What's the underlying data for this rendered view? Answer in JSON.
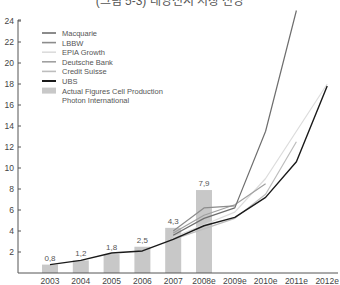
{
  "title": "(그림 5-3) 태양전지 시장 전망",
  "chart_data": {
    "type": "bar+line",
    "title": "",
    "xlabel": "",
    "ylabel": "",
    "ylim": [
      0,
      24
    ],
    "yticks": [
      2,
      4,
      6,
      8,
      10,
      12,
      14,
      16,
      18,
      20,
      22,
      24
    ],
    "categories": [
      "2003",
      "2004",
      "2005",
      "2006",
      "2007",
      "2008e",
      "2009e",
      "2010e",
      "2011e",
      "2012e"
    ],
    "bars": {
      "name": "Actual Figures Cell Production Photon International",
      "color": "#c8c8c8",
      "values": [
        0.8,
        1.2,
        1.8,
        2.5,
        4.3,
        7.9,
        null,
        null,
        null,
        null
      ],
      "labels": [
        "0,8",
        "1,2",
        "1,8",
        "2,5",
        "4,3",
        "7,9"
      ]
    },
    "series": [
      {
        "name": "Macquarie",
        "color": "#6e6e6e",
        "values": [
          null,
          null,
          null,
          null,
          3.6,
          5.2,
          6.2,
          13.5,
          25,
          null
        ]
      },
      {
        "name": "LBBW",
        "color": "#8c8c8c",
        "values": [
          null,
          null,
          null,
          null,
          4.0,
          6.2,
          6.4,
          null,
          null,
          null
        ]
      },
      {
        "name": "EPIA Growth",
        "color": "#dcdcdc",
        "values": [
          null,
          null,
          null,
          null,
          3.4,
          4.6,
          5.8,
          9.0,
          13.5,
          18.0
        ]
      },
      {
        "name": "Deutsche Bank",
        "color": "#a0a0a0",
        "values": [
          null,
          null,
          null,
          null,
          3.8,
          5.5,
          6.5,
          8.5,
          null,
          null
        ]
      },
      {
        "name": "Credit Suisse",
        "color": "#bdbdbd",
        "values": [
          null,
          null,
          null,
          null,
          3.2,
          4.2,
          5.2,
          7.5,
          12.5,
          null
        ]
      },
      {
        "name": "UBS",
        "color": "#1a1a1a",
        "values": [
          0.8,
          1.2,
          1.9,
          2.1,
          3.2,
          4.5,
          5.3,
          7.2,
          10.6,
          17.8
        ]
      }
    ],
    "legend": {
      "position": "top-left",
      "entries": [
        "Macquarie",
        "LBBW",
        "EPIA Growth",
        "Deutsche Bank",
        "Credit Suisse",
        "UBS",
        "Actual Figures Cell Production",
        "Photon International"
      ]
    },
    "grid": false
  }
}
